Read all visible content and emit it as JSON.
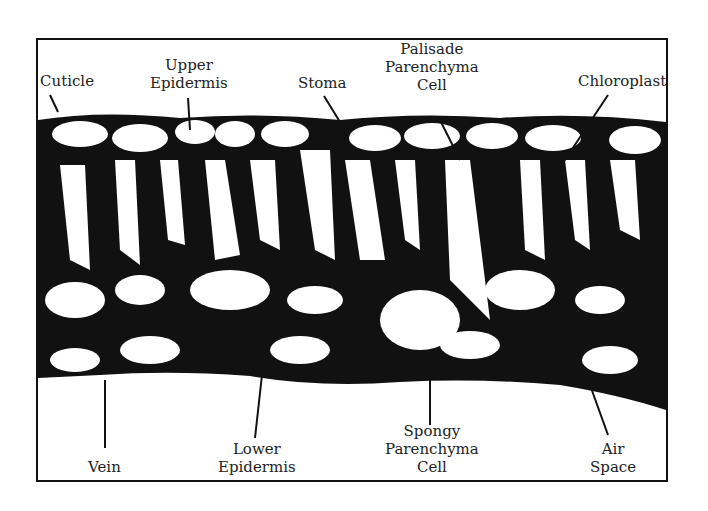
{
  "figure": {
    "labels": {
      "cuticle": "Cuticle",
      "upper_epidermis": "Upper\nEpidermis",
      "stoma": "Stoma",
      "palisade": "Palisade\nParenchyma\nCell",
      "chloroplast": "Chloroplast",
      "vein": "Vein",
      "lower_epidermis": "Lower\nEpidermis",
      "spongy": "Spongy\nParenchyma\nCell",
      "air_space": "Air\nSpace"
    }
  }
}
